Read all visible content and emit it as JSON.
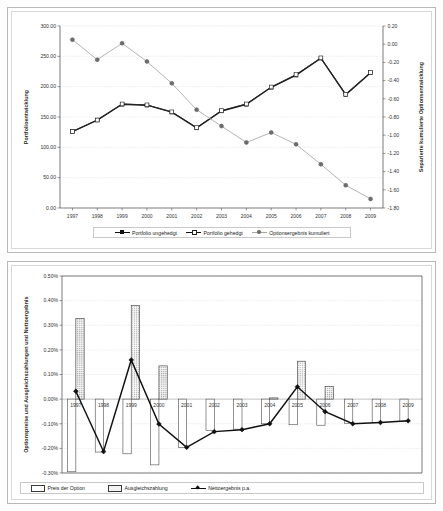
{
  "chart_data": [
    {
      "id": "portfolio-chart",
      "type": "line",
      "title": "",
      "xlabel": "",
      "ylabel": "Portfolioentwicklung",
      "y2label": "Separierte kumulierte Optionsentwicklung",
      "categories": [
        "1997",
        "1998",
        "1999",
        "2000",
        "2001",
        "2002",
        "2003",
        "2004",
        "2005",
        "2006",
        "2007",
        "2008",
        "2009"
      ],
      "ylim": [
        0.0,
        300.0
      ],
      "yticks": [
        0.0,
        50.0,
        100.0,
        150.0,
        200.0,
        250.0,
        300.0
      ],
      "ytick_labels": [
        "0.00",
        "50.00",
        "100.00",
        "150.00",
        "200.00",
        "250.00",
        "300.00"
      ],
      "y2lim": [
        -1.8,
        0.2
      ],
      "y2ticks": [
        0.2,
        0.0,
        -0.2,
        -0.4,
        -0.6,
        -0.8,
        -1.0,
        -1.2,
        -1.4,
        -1.6,
        -1.8
      ],
      "y2tick_labels": [
        "0.20",
        "0.00",
        "-0.20",
        "-0.40",
        "-0.60",
        "-0.80",
        "-1.00",
        "-1.20",
        "-1.40",
        "-1.60",
        "-1.80"
      ],
      "grid": true,
      "legend_position": "bottom",
      "series": [
        {
          "name": "Portfolio ungehedgt",
          "axis": "left",
          "marker": "square-filled",
          "color": "#111111",
          "values": [
            126.0,
            145.0,
            171.0,
            169.5,
            158.0,
            132.0,
            160.0,
            171.0,
            199.0,
            219.0,
            247.0,
            187.0,
            223.0
          ]
        },
        {
          "name": "Portfolio gehedgt",
          "axis": "left",
          "marker": "square-hollow",
          "color": "#2b2b2b",
          "values": [
            126.0,
            145.0,
            171.5,
            170.0,
            158.5,
            132.5,
            160.5,
            171.5,
            199.5,
            220.0,
            247.5,
            187.5,
            223.5
          ]
        },
        {
          "name": "Optionsergebnis kumuliert",
          "axis": "right",
          "marker": "circle",
          "color": "#a6a6a6",
          "values": [
            0.05,
            -0.17,
            0.01,
            -0.19,
            -0.43,
            -0.72,
            -0.9,
            -1.08,
            -0.97,
            -1.1,
            -1.32,
            -1.55,
            -1.7
          ]
        }
      ]
    },
    {
      "id": "option-chart",
      "type": "bar",
      "title": "",
      "xlabel": "",
      "ylabel": "Optionspreise und Ausgleichszahlungen und Nettoergebnis",
      "categories": [
        "1997",
        "1998",
        "1999",
        "2000",
        "2001",
        "2002",
        "2003",
        "2004",
        "2005",
        "2006",
        "2007",
        "2008",
        "2009"
      ],
      "ylim": [
        -0.3,
        0.5
      ],
      "yticks": [
        0.5,
        0.4,
        0.3,
        0.2,
        0.1,
        0.0,
        -0.1,
        -0.2,
        -0.3
      ],
      "ytick_labels": [
        "0.50%",
        "0.40%",
        "0.30%",
        "0.20%",
        "0.10%",
        "0.00%",
        "-0.10%",
        "-0.20%",
        "-0.30%"
      ],
      "grid": true,
      "legend_position": "bottom",
      "series": [
        {
          "name": "Preis der Option",
          "kind": "bar",
          "style": "outline",
          "values": [
            -0.295,
            -0.215,
            -0.222,
            -0.267,
            -0.196,
            -0.128,
            -0.122,
            -0.1,
            -0.104,
            -0.106,
            -0.098,
            -0.095,
            -0.091
          ]
        },
        {
          "name": "Ausgleichszahlung",
          "kind": "bar",
          "style": "dotted",
          "values": [
            0.327,
            0.0,
            0.381,
            0.135,
            0.0,
            0.0,
            0.0,
            0.005,
            0.154,
            0.052,
            0.0,
            0.0,
            0.0
          ]
        },
        {
          "name": "Nettoergebnis p.a.",
          "kind": "line",
          "marker": "diamond",
          "color": "#111111",
          "values": [
            0.032,
            -0.213,
            0.159,
            -0.101,
            -0.196,
            -0.132,
            -0.124,
            -0.1,
            0.05,
            -0.051,
            -0.1,
            -0.095,
            -0.088
          ]
        }
      ]
    }
  ],
  "top_chart": {
    "ylabel": "Portfolioentwicklung",
    "y2label": "Separierte kumulierte Optionsentwicklung",
    "legend": [
      {
        "label": "Portfolio ungehedgt"
      },
      {
        "label": "Portfolio gehedgt"
      },
      {
        "label": "Optionsergebnis kumuliert"
      }
    ]
  },
  "bottom_chart": {
    "ylabel": "Optionspreise und Ausgleichszahlungen und Nettoergebnis",
    "legend": [
      {
        "label": "Preis der Option"
      },
      {
        "label": "Ausgleichszahlung"
      },
      {
        "label": "Nettoergebnis p.a."
      }
    ]
  }
}
